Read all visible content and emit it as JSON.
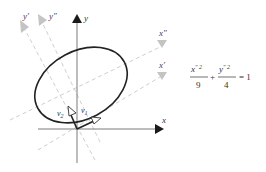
{
  "diagram": {
    "axes": {
      "x_label": "x",
      "y_label": "y",
      "x_prime_label": "x′",
      "y_prime_label": "y′",
      "x_double_prime_label": "x″",
      "y_double_prime_label": "y″"
    },
    "vectors": {
      "v1_label": "v",
      "v1_sub": "1",
      "v2_label": "v",
      "v2_sub": "2"
    },
    "equation": {
      "term1_num": "x",
      "term1_num_sup": "″ 2",
      "term1_den": "9",
      "plus": "+",
      "term2_num": "y",
      "term2_num_sup": "″ 2",
      "term2_den": "4",
      "equals": "= 1"
    },
    "colors": {
      "main_axis": "#7a7a7a",
      "arrow_dark": "#1a1a1a",
      "dashed_axis": "#c8c8c8",
      "ellipse": "#222222"
    }
  }
}
